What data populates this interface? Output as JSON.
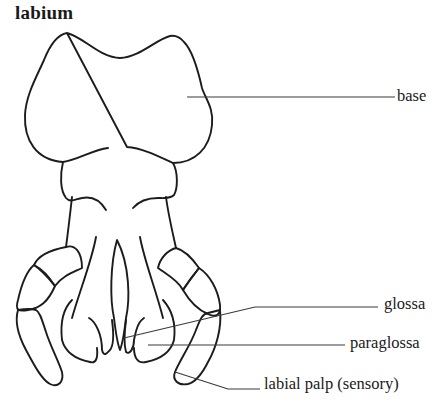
{
  "diagram": {
    "title": "labium",
    "labels": {
      "base": "base",
      "glossa": "glossa",
      "paraglossa": "paraglossa",
      "labial_palp": "labial palp (sensory)"
    },
    "colors": {
      "line": "#1c1c1c",
      "leader": "#3a3a3a",
      "background": "#ffffff"
    }
  }
}
